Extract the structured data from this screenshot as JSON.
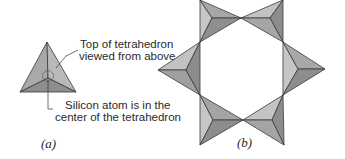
{
  "panel_a": {
    "caption": "(a)",
    "callout_top_line1": "Top of tetrahedron",
    "callout_top_line2": "viewed from above",
    "callout_bottom_line1": "Silicon atom is in the",
    "callout_bottom_line2": "center of the tetrahedron"
  },
  "panel_b": {
    "caption": "(b)",
    "description": "Six-membered ring of silicate tetrahedra sharing corners"
  },
  "colors": {
    "face_light": "#c4c4c4",
    "face_mid": "#a6a6a6",
    "face_dark": "#8a8a8a",
    "edge": "#3a3a3a",
    "text": "#2a2a2a"
  }
}
